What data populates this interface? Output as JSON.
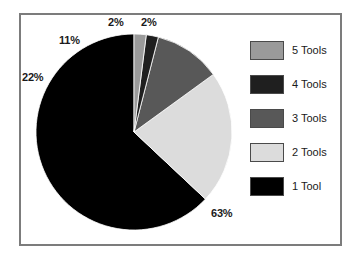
{
  "chart_data": {
    "type": "pie",
    "title": "",
    "subtitle": "",
    "xlabel": "",
    "ylabel": "",
    "legend_position": "right",
    "grid": false,
    "start_angle_deg": 90,
    "direction": "counterclockwise",
    "categories": [
      "1 Tool",
      "2 Tools",
      "3 Tools",
      "4 Tools",
      "5 Tools"
    ],
    "values": [
      63,
      22,
      11,
      2,
      2
    ],
    "value_unit": "%",
    "data_labels": [
      "63%",
      "22%",
      "11%",
      "2%",
      "2%"
    ],
    "colors": [
      "#000000",
      "#dcdcdc",
      "#585858",
      "#1f1f1f",
      "#9a9a9a"
    ],
    "slices": [
      {
        "label": "1 Tool",
        "value": 63,
        "data_label": "63%",
        "color": "#000000"
      },
      {
        "label": "2 Tools",
        "value": 22,
        "data_label": "22%",
        "color": "#dcdcdc"
      },
      {
        "label": "3 Tools",
        "value": 11,
        "data_label": "11%",
        "color": "#585858"
      },
      {
        "label": "4 Tools",
        "value": 2,
        "data_label": "2%",
        "color": "#1f1f1f"
      },
      {
        "label": "5 Tools",
        "value": 2,
        "data_label": "2%",
        "color": "#9a9a9a"
      }
    ]
  },
  "legend": {
    "entries": [
      {
        "label": "5 Tools",
        "color": "#9a9a9a"
      },
      {
        "label": "4 Tools",
        "color": "#1f1f1f"
      },
      {
        "label": "3 Tools",
        "color": "#585858"
      },
      {
        "label": "2 Tools",
        "color": "#dcdcdc"
      },
      {
        "label": "1 Tool",
        "color": "#000000"
      }
    ]
  },
  "labels": {
    "pct_63": "63%",
    "pct_22": "22%",
    "pct_11": "11%",
    "pct_4tools": "2%",
    "pct_5tools": "2%"
  },
  "style": {
    "frame_color": "#7c7c7c",
    "background": "#ffffff",
    "text_color": "#1a1a1a"
  }
}
